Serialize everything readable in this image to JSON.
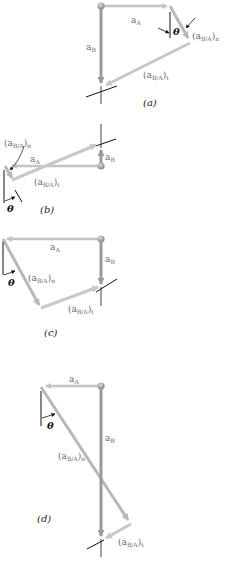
{
  "figure": {
    "colors": {
      "a_A": "#c4c4c4",
      "a_B": "#9a9a9a",
      "a_BA_n": "#b8b8b8",
      "a_BA_t": "#c8c8c8",
      "point": "#a0a0a0",
      "reference_line": "#111111",
      "label": "#6a6a6a"
    },
    "panels": [
      {
        "caption": "(a)",
        "labels": {
          "a_A": "a",
          "a_A_sub": "A",
          "a_B": "a",
          "a_B_sub": "B",
          "n": "(a",
          "n_sub": "B/A",
          "n_post": ")",
          "n_subsub": "n",
          "t": "(a",
          "t_sub": "B/A",
          "t_post": ")",
          "t_subsub": "t",
          "theta": "θ"
        }
      },
      {
        "caption": "(b)",
        "labels": {
          "a_A": "a",
          "a_A_sub": "A",
          "a_B": "a",
          "a_B_sub": "B",
          "n": "(a",
          "n_sub": "B/A",
          "n_post": ")",
          "n_subsub": "n",
          "t": "(a",
          "t_sub": "B/A",
          "t_post": ")",
          "t_subsub": "t",
          "theta": "θ"
        }
      },
      {
        "caption": "(c)",
        "labels": {
          "a_A": "a",
          "a_A_sub": "A",
          "a_B": "a",
          "a_B_sub": "B",
          "n": "(a",
          "n_sub": "B/A",
          "n_post": ")",
          "n_subsub": "n",
          "t": "(a",
          "t_sub": "B/A",
          "t_post": ")",
          "t_subsub": "t",
          "theta": "θ"
        }
      },
      {
        "caption": "(d)",
        "labels": {
          "a_A": "a",
          "a_A_sub": "A",
          "a_B": "a",
          "a_B_sub": "B",
          "n": "(a",
          "n_sub": "B/A",
          "n_post": ")",
          "n_subsub": "n",
          "t": "(a",
          "t_sub": "B/A",
          "t_post": ")",
          "t_subsub": "t",
          "theta": "θ"
        }
      }
    ]
  }
}
